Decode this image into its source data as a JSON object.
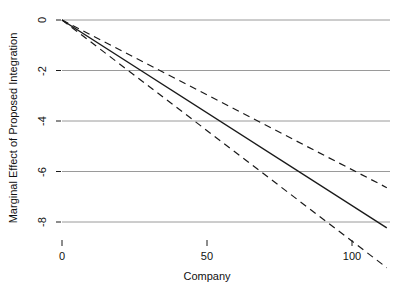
{
  "chart_data": {
    "type": "line",
    "title": "",
    "xlabel": "Company",
    "ylabel": "Marginal Effect of Proposed Integration",
    "xlim": [
      -3,
      113
    ],
    "ylim": [
      -9.2,
      0.4
    ],
    "xticks": [
      0,
      50,
      100
    ],
    "xticklabels": [
      "0",
      "50",
      "100"
    ],
    "yticks": [
      0,
      -2,
      -4,
      -6,
      -8
    ],
    "yticklabels": [
      "0",
      "-2",
      "-4",
      "-6",
      "-8"
    ],
    "grid": "horizontal",
    "grid_color": "#9a9a9a",
    "legend": "none",
    "line_color": "#1a1a1a",
    "band_color": "#1a1a1a",
    "series": [
      {
        "name": "Marginal effect (fitted)",
        "style": "solid",
        "x": [
          0,
          10,
          20,
          30,
          40,
          50,
          60,
          70,
          80,
          90,
          100,
          112
        ],
        "values": [
          0.0,
          -0.73,
          -1.47,
          -2.2,
          -2.94,
          -3.67,
          -4.41,
          -5.14,
          -5.88,
          -6.61,
          -7.35,
          -8.23
        ]
      },
      {
        "name": "Upper 95% confidence bound",
        "style": "dashed",
        "x": [
          0,
          10,
          20,
          30,
          40,
          50,
          60,
          70,
          80,
          90,
          100,
          112
        ],
        "values": [
          0.0,
          -0.64,
          -1.26,
          -1.88,
          -2.48,
          -3.08,
          -3.67,
          -4.25,
          -4.83,
          -5.4,
          -5.97,
          -6.64
        ]
      },
      {
        "name": "Lower 95% confidence bound",
        "style": "dashed",
        "x": [
          0,
          10,
          20,
          30,
          40,
          50,
          60,
          70,
          80,
          90,
          100,
          112
        ],
        "values": [
          0.0,
          -0.82,
          -1.68,
          -2.53,
          -3.4,
          -4.27,
          -5.15,
          -6.04,
          -6.93,
          -7.82,
          -8.72,
          -9.81
        ]
      }
    ]
  },
  "axes": {
    "y_title": "Marginal Effect of Proposed Integration",
    "x_title": "Company",
    "y_tick_0": "0",
    "y_tick_1": "-2",
    "y_tick_2": "-4",
    "y_tick_3": "-6",
    "y_tick_4": "-8",
    "x_tick_0": "0",
    "x_tick_1": "50",
    "x_tick_2": "100"
  }
}
